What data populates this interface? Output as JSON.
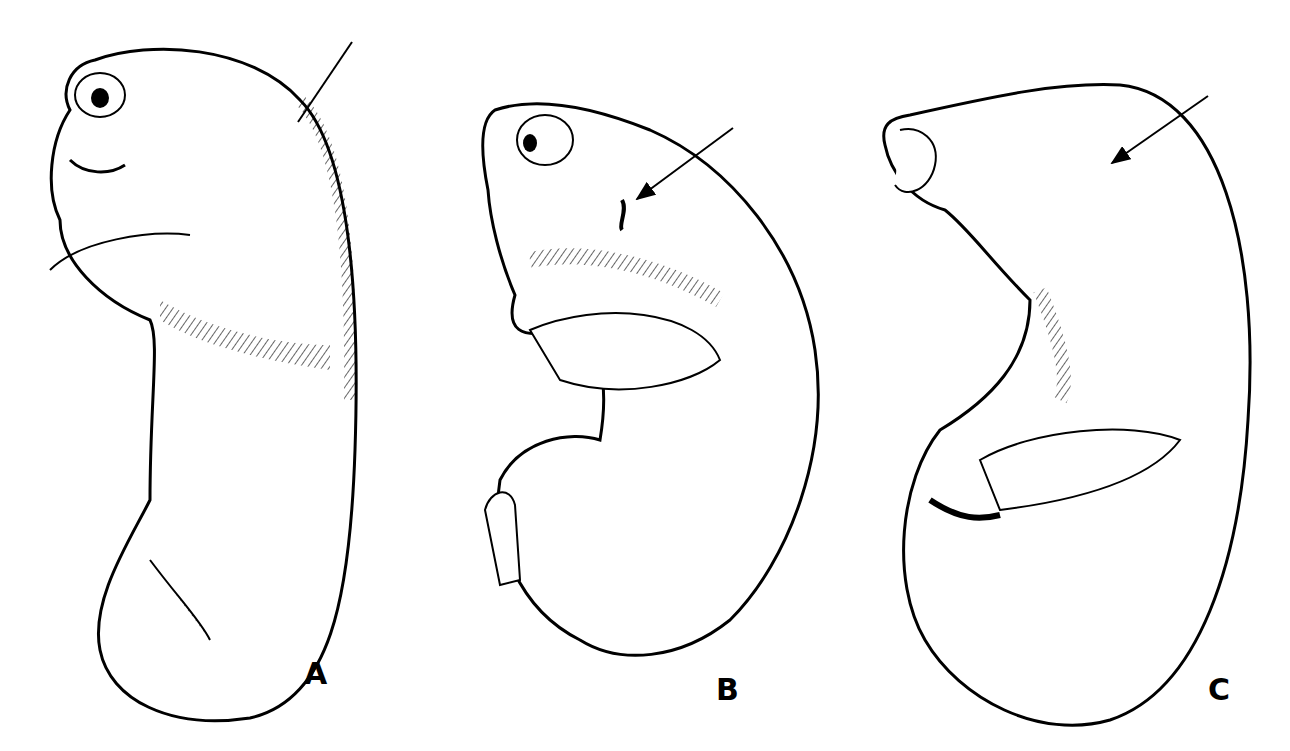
{
  "figure": {
    "panels": [
      {
        "label": "A",
        "has_arrow": true
      },
      {
        "label": "B",
        "has_arrow": true
      },
      {
        "label": "C",
        "has_arrow": true
      }
    ],
    "colors": {
      "ink": "#000000",
      "background": "#ffffff"
    }
  }
}
